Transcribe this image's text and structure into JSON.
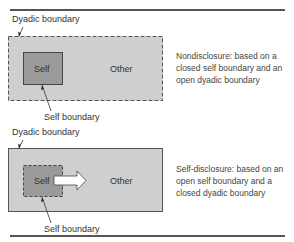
{
  "panels": [
    {
      "id": "nondisclosure",
      "dyadic_label": "Dyadic boundary",
      "self_label": "Self",
      "other_label": "Other",
      "self_boundary_label": "Self boundary",
      "dyadic_boundary_style": "open (dashed)",
      "self_boundary_style": "closed (solid)",
      "arrow": false,
      "description": "Nondisclosure:  based on a closed self boundary and an open dyadic boundary"
    },
    {
      "id": "self-disclosure",
      "dyadic_label": "Dyadic boundary",
      "self_label": "Self",
      "other_label": "Other",
      "self_boundary_label": "Self boundary",
      "dyadic_boundary_style": "closed (solid)",
      "self_boundary_style": "open (dashed)",
      "arrow": true,
      "description": "Self-disclosure:  based on an open self boundary and a closed dyadic boundary"
    }
  ],
  "colors": {
    "dyadic_fill": "#cfcfcf",
    "self_fill": "#9a9a9a",
    "border": "#555555",
    "arrow_fill": "#ffffff"
  }
}
